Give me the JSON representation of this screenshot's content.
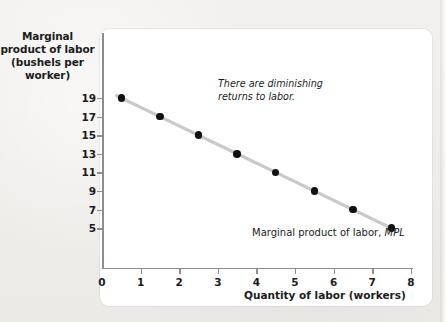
{
  "chart_data": {
    "type": "line",
    "title": "",
    "xlabel": "Quantity of labor (workers)",
    "ylabel": "Marginal product of labor (bushels per worker)",
    "ylabel_lines": [
      "Marginal",
      "product of labor",
      "(bushels per",
      "worker)"
    ],
    "x": [
      0.5,
      1.5,
      2.5,
      3.5,
      4.5,
      5.5,
      6.5,
      7.5
    ],
    "values": [
      19,
      17,
      15,
      13,
      11,
      9,
      7,
      5
    ],
    "series": [
      {
        "name": "Marginal product of labor, MPL",
        "values": [
          19,
          17,
          15,
          13,
          11,
          9,
          7,
          5
        ]
      }
    ],
    "xlim": [
      0,
      8
    ],
    "ylim": [
      4,
      20
    ],
    "xticks": [
      "0",
      "1",
      "2",
      "3",
      "4",
      "5",
      "6",
      "7",
      "8"
    ],
    "xtick_values": [
      0,
      1,
      2,
      3,
      4,
      5,
      6,
      7,
      8
    ],
    "yticks": [
      "19",
      "17",
      "15",
      "13",
      "11",
      "9",
      "7",
      "5"
    ],
    "ytick_values": [
      19,
      17,
      15,
      13,
      11,
      9,
      7,
      5
    ],
    "grid": false,
    "legend": "none",
    "annotations": [
      {
        "name": "diminishing-returns-note",
        "text": "There are diminishing returns to labor.",
        "lines": [
          "There are diminishing",
          "returns to labor."
        ],
        "style": "italic"
      },
      {
        "name": "curve-label",
        "text_plain": "Marginal product of labor,",
        "text_italic": "MPL",
        "style": "regular-with-italic-symbol"
      }
    ],
    "colors": {
      "line": "#c9c9c9",
      "marker": "#111111",
      "axis": "#8d8d8d",
      "panel": "#ffffff",
      "page": "#efeeec",
      "text": "#1b1b1b"
    }
  }
}
